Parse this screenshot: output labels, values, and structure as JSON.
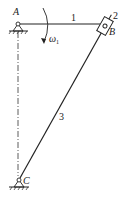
{
  "diagram": {
    "type": "mechanism-kinematic-sketch",
    "colors": {
      "line": "#222222",
      "background": "#ffffff"
    },
    "joints": {
      "A": {
        "label": "A",
        "x": 18,
        "y": 24,
        "ground": true
      },
      "B": {
        "label": "B",
        "x": 105,
        "y": 26
      },
      "C": {
        "label": "C",
        "x": 19,
        "y": 180,
        "ground": true
      }
    },
    "links": [
      {
        "id": "1",
        "label": "1",
        "from": "A",
        "to": "B"
      },
      {
        "id": "2",
        "label": "2",
        "kind": "slider",
        "at": "B"
      },
      {
        "id": "3",
        "label": "3",
        "from": "B",
        "to": "C"
      }
    ],
    "angular_velocity": {
      "label": "ω",
      "subscript": "1",
      "link": "1",
      "direction": "clockwise"
    },
    "centerline": {
      "from": "A",
      "to": "C",
      "style": "dash-dot"
    }
  }
}
